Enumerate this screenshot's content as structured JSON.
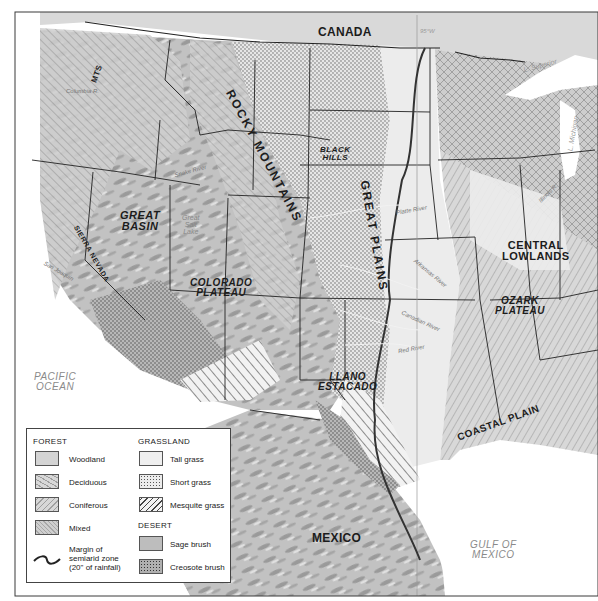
{
  "map": {
    "title_regions": {
      "canada": "CANADA",
      "mexico": "MEXICO",
      "pacific_ocean": [
        "PACIFIC",
        "OCEAN"
      ],
      "gulf_of_mexico": [
        "GULF OF",
        "MEXICO"
      ],
      "rocky_mountains": "ROCKY MOUNTAINS",
      "great_plains": "GREAT PLAINS",
      "great_basin": [
        "GREAT",
        "BASIN"
      ],
      "colorado_plateau": [
        "COLORADO",
        "PLATEAU"
      ],
      "central_lowlands": [
        "CENTRAL",
        "LOWLANDS"
      ],
      "ozark_plateau": [
        "OZARK",
        "PLATEAU"
      ],
      "llano_estacado": [
        "LLANO",
        "ESTACADO"
      ],
      "coastal_plain": "COASTAL PLAIN",
      "black_hills": [
        "BLACK",
        "HILLS"
      ],
      "cascade_mts": "CASCADE",
      "mts": "MTS",
      "sierra_nevada": "SIERRA NEVADA",
      "great_salt_lake": [
        "Great",
        "Salt",
        "Lake"
      ]
    },
    "meridian_label": "95°W",
    "lakes": {
      "superior": "L. Superior",
      "michigan": "L. Michigan"
    },
    "rivers": {
      "platte": "Platte River",
      "arkansas": "Arkansas River",
      "canadian": "Canadian River",
      "red": "Red River",
      "illinois": "Illinois R.",
      "snake": "Snake River",
      "columbia": "Columbia R.",
      "missouri": "Missouri River",
      "san_joaquin": "San Joaquin"
    }
  },
  "legend": {
    "forest": {
      "header": "FOREST",
      "items": [
        {
          "label": "Woodland",
          "pattern": "woodland"
        },
        {
          "label": "Deciduous",
          "pattern": "deciduous"
        },
        {
          "label": "Coniferous",
          "pattern": "coniferous"
        },
        {
          "label": "Mixed",
          "pattern": "mixed"
        }
      ]
    },
    "semiarid": {
      "line1": "Margin of",
      "line2": "semiarid zone",
      "line3": "(20\" of rainfall)"
    },
    "grassland": {
      "header": "GRASSLAND",
      "items": [
        {
          "label": "Tall grass",
          "pattern": "tallgrass"
        },
        {
          "label": "Short grass",
          "pattern": "shortgrass"
        },
        {
          "label": "Mesquite grass",
          "pattern": "mesquite"
        }
      ]
    },
    "desert": {
      "header": "DESERT",
      "items": [
        {
          "label": "Sage brush",
          "pattern": "sage"
        },
        {
          "label": "Creosote brush",
          "pattern": "creosote"
        }
      ]
    }
  },
  "colors": {
    "frame": "#3a3a3a",
    "relief": "#bdbdbd",
    "relief_dark": "#8e8e8e",
    "canada": "#d9d9d9",
    "water": "#ffffff",
    "tallgrass": "#ececec",
    "border": "#222222"
  }
}
